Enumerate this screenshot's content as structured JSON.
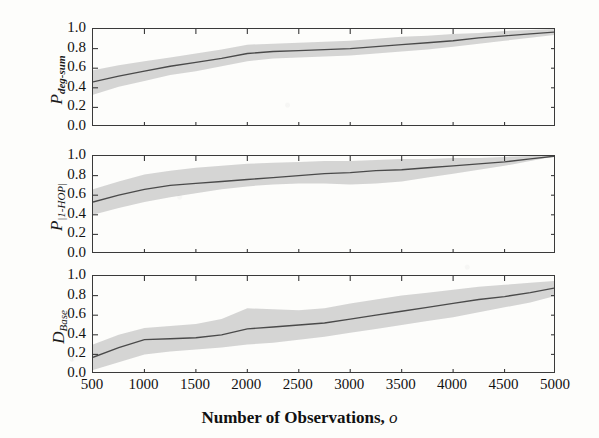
{
  "figure": {
    "xlabel_text": "Number of Observations,",
    "xlabel_var": "o",
    "band_color": "#c9c9c9",
    "line_color": "#4a4a4a",
    "axis_color": "#3a3a3a"
  },
  "chart_data": [
    {
      "type": "line",
      "title": "",
      "panel_index": 0,
      "ylabel": "P_deg-sum",
      "ylabel_main": "P",
      "ylabel_sub": "deg-sum",
      "xlabel": "",
      "xlim": [
        500,
        5000
      ],
      "ylim": [
        0.0,
        1.0
      ],
      "grid": false,
      "legend": "none",
      "xticks": [
        500,
        1000,
        1500,
        2000,
        2500,
        3000,
        3500,
        4000,
        4500,
        5000
      ],
      "xticklabels": [
        "",
        "",
        "",
        "",
        "",
        "",
        "",
        "",
        "",
        ""
      ],
      "yticks": [
        0.0,
        0.2,
        0.4,
        0.6,
        0.8,
        1.0
      ],
      "yticklabels": [
        "0.0",
        "0.2",
        "0.4",
        "0.6",
        "0.8",
        "1.0"
      ],
      "x": [
        500,
        750,
        1000,
        1250,
        1500,
        1750,
        2000,
        2250,
        2500,
        2750,
        3000,
        3250,
        3500,
        3750,
        4000,
        4250,
        4500,
        4750,
        5000
      ],
      "series": [
        {
          "name": "mean",
          "values": [
            0.46,
            0.52,
            0.57,
            0.62,
            0.66,
            0.7,
            0.75,
            0.77,
            0.78,
            0.79,
            0.8,
            0.82,
            0.84,
            0.86,
            0.88,
            0.91,
            0.93,
            0.95,
            0.97
          ]
        },
        {
          "name": "band_upper",
          "values": [
            0.58,
            0.63,
            0.67,
            0.71,
            0.75,
            0.79,
            0.84,
            0.85,
            0.86,
            0.87,
            0.88,
            0.9,
            0.92,
            0.93,
            0.95,
            0.96,
            0.98,
            0.99,
            1.0
          ]
        },
        {
          "name": "band_lower",
          "values": [
            0.33,
            0.41,
            0.47,
            0.53,
            0.57,
            0.62,
            0.67,
            0.7,
            0.71,
            0.72,
            0.73,
            0.75,
            0.77,
            0.79,
            0.82,
            0.85,
            0.88,
            0.91,
            0.94
          ]
        }
      ]
    },
    {
      "type": "line",
      "title": "",
      "panel_index": 1,
      "ylabel": "P_|1-HOP|",
      "ylabel_main": "P",
      "ylabel_sub": "|1-HOP|",
      "xlabel": "",
      "xlim": [
        500,
        5000
      ],
      "ylim": [
        0.0,
        1.0
      ],
      "grid": false,
      "legend": "none",
      "xticks": [
        500,
        1000,
        1500,
        2000,
        2500,
        3000,
        3500,
        4000,
        4500,
        5000
      ],
      "xticklabels": [
        "",
        "",
        "",
        "",
        "",
        "",
        "",
        "",
        "",
        ""
      ],
      "yticks": [
        0.0,
        0.2,
        0.4,
        0.6,
        0.8,
        1.0
      ],
      "yticklabels": [
        "0.0",
        "0.2",
        "0.4",
        "0.6",
        "0.8",
        "1.0"
      ],
      "x": [
        500,
        750,
        1000,
        1250,
        1500,
        1750,
        2000,
        2250,
        2500,
        2750,
        3000,
        3250,
        3500,
        3750,
        4000,
        4250,
        4500,
        4750,
        5000
      ],
      "series": [
        {
          "name": "mean",
          "values": [
            0.53,
            0.6,
            0.66,
            0.7,
            0.72,
            0.74,
            0.76,
            0.78,
            0.8,
            0.82,
            0.83,
            0.85,
            0.86,
            0.88,
            0.9,
            0.92,
            0.94,
            0.97,
            1.0
          ]
        },
        {
          "name": "band_upper",
          "values": [
            0.66,
            0.74,
            0.81,
            0.85,
            0.88,
            0.9,
            0.92,
            0.93,
            0.94,
            0.95,
            0.95,
            0.96,
            0.97,
            0.97,
            0.98,
            0.98,
            0.99,
            1.0,
            1.0
          ]
        },
        {
          "name": "band_lower",
          "values": [
            0.4,
            0.47,
            0.53,
            0.58,
            0.62,
            0.66,
            0.69,
            0.71,
            0.72,
            0.72,
            0.71,
            0.72,
            0.74,
            0.78,
            0.82,
            0.86,
            0.9,
            0.95,
            1.0
          ]
        }
      ]
    },
    {
      "type": "line",
      "title": "",
      "panel_index": 2,
      "ylabel": "D_Base",
      "ylabel_main": "D",
      "ylabel_sub": "Base",
      "xlabel": "Number of Observations, o",
      "xlim": [
        500,
        5000
      ],
      "ylim": [
        0.0,
        1.0
      ],
      "grid": false,
      "legend": "none",
      "xticks": [
        500,
        1000,
        1500,
        2000,
        2500,
        3000,
        3500,
        4000,
        4500,
        5000
      ],
      "xticklabels": [
        "500",
        "1000",
        "1500",
        "2000",
        "2500",
        "3000",
        "3500",
        "4000",
        "4500",
        "5000"
      ],
      "yticks": [
        0.0,
        0.2,
        0.4,
        0.6,
        0.8,
        1.0
      ],
      "yticklabels": [
        "0.0",
        "0.2",
        "0.4",
        "0.6",
        "0.8",
        "1.0"
      ],
      "x": [
        500,
        750,
        1000,
        1250,
        1500,
        1750,
        2000,
        2250,
        2500,
        2750,
        3000,
        3250,
        3500,
        3750,
        4000,
        4250,
        4500,
        4750,
        5000
      ],
      "series": [
        {
          "name": "mean",
          "values": [
            0.17,
            0.27,
            0.35,
            0.36,
            0.37,
            0.4,
            0.46,
            0.48,
            0.5,
            0.52,
            0.56,
            0.6,
            0.64,
            0.68,
            0.72,
            0.76,
            0.79,
            0.83,
            0.88
          ]
        },
        {
          "name": "band_upper",
          "values": [
            0.3,
            0.4,
            0.47,
            0.49,
            0.51,
            0.56,
            0.67,
            0.66,
            0.65,
            0.67,
            0.72,
            0.76,
            0.8,
            0.83,
            0.86,
            0.89,
            0.91,
            0.93,
            0.95
          ]
        },
        {
          "name": "band_lower",
          "values": [
            0.04,
            0.12,
            0.2,
            0.23,
            0.25,
            0.27,
            0.3,
            0.32,
            0.35,
            0.38,
            0.42,
            0.46,
            0.5,
            0.54,
            0.58,
            0.63,
            0.68,
            0.73,
            0.8
          ]
        }
      ]
    }
  ]
}
